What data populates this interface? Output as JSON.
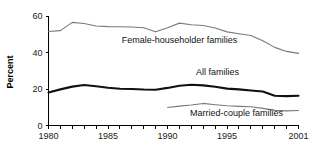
{
  "chart_data": {
    "type": "line",
    "title": "",
    "xlabel": "",
    "ylabel": "Percent",
    "xlim": [
      1980,
      2001
    ],
    "ylim": [
      0,
      60
    ],
    "grid": false,
    "legend_position": "inline-annotations",
    "x_ticks": [
      1980,
      1981,
      1982,
      1983,
      1984,
      1985,
      1986,
      1987,
      1988,
      1989,
      1990,
      1991,
      1992,
      1993,
      1994,
      1995,
      1996,
      1997,
      1998,
      1999,
      2000,
      2001
    ],
    "x_tick_labels": [
      "1980",
      "",
      "",
      "",
      "",
      "1985",
      "",
      "",
      "",
      "",
      "1990",
      "",
      "",
      "",
      "",
      "1995",
      "",
      "",
      "",
      "",
      "",
      "2001"
    ],
    "y_ticks": [
      0,
      20,
      40,
      60
    ],
    "y_tick_labels": [
      "0",
      "20",
      "40",
      "60"
    ],
    "series": [
      {
        "name": "Female-householder families",
        "label": "Female-householder families",
        "style": "thin-gray",
        "color": "#7a7a7a",
        "x": [
          1980,
          1981,
          1982,
          1983,
          1984,
          1985,
          1986,
          1987,
          1988,
          1989,
          1990,
          1991,
          1992,
          1993,
          1994,
          1995,
          1996,
          1997,
          1998,
          1999,
          2000,
          2001
        ],
        "values": [
          51.5,
          52.0,
          56.5,
          55.9,
          54.5,
          54.2,
          54.1,
          54.0,
          53.6,
          51.4,
          53.6,
          56.1,
          55.2,
          54.8,
          53.4,
          51.3,
          50.3,
          49.3,
          46.4,
          42.8,
          40.6,
          39.5
        ]
      },
      {
        "name": "All families",
        "label": "All families",
        "style": "thick-black",
        "color": "#111111",
        "x": [
          1980,
          1981,
          1982,
          1983,
          1984,
          1985,
          1986,
          1987,
          1988,
          1989,
          1990,
          1991,
          1992,
          1993,
          1994,
          1995,
          1996,
          1997,
          1998,
          1999,
          2000,
          2001
        ],
        "values": [
          18.1,
          19.8,
          21.3,
          22.2,
          21.5,
          20.7,
          20.1,
          20.0,
          19.7,
          19.6,
          20.6,
          21.8,
          22.3,
          22.0,
          21.2,
          20.2,
          19.8,
          19.2,
          18.6,
          16.3,
          16.1,
          16.3
        ]
      },
      {
        "name": "Married-couple families",
        "label": "Married-couple families",
        "style": "thin-gray",
        "color": "#7a7a7a",
        "x": [
          1990,
          1991,
          1992,
          1993,
          1994,
          1995,
          1996,
          1997,
          1998,
          1999,
          2000,
          2001
        ],
        "values": [
          9.9,
          10.6,
          11.2,
          12.1,
          11.4,
          10.8,
          10.5,
          10.3,
          9.4,
          8.3,
          8.0,
          8.2
        ]
      }
    ],
    "annotations": [
      {
        "text": "Female-householder families",
        "x": 1991.0,
        "y": 45.0
      },
      {
        "text": "All families",
        "x": 1994.2,
        "y": 27.6
      },
      {
        "text": "Married-couple families",
        "x": 1995.8,
        "y": 5.4
      }
    ]
  }
}
